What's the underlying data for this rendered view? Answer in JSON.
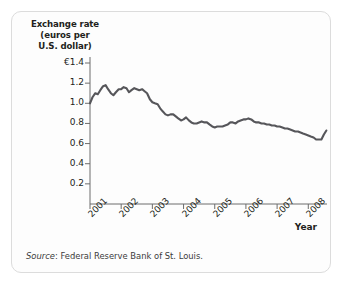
{
  "figure": {
    "y_axis_title_lines": [
      "Exchange rate",
      "(euros per",
      "U.S. dollar)"
    ],
    "x_axis_title": "Year",
    "source_label": "Source",
    "source_text": ": Federal Reserve Bank of St. Louis.",
    "line_color": "#56565a",
    "axis_color": "#6d6d6d",
    "text_color": "#231f20"
  },
  "chart_data": {
    "type": "line",
    "title": "",
    "xlabel": "Year",
    "ylabel": "Exchange rate (euros per U.S. dollar)",
    "ylim": [
      0,
      1.4
    ],
    "xlim": [
      2001,
      2008.6
    ],
    "grid": false,
    "legend": "none",
    "ytick_labels": [
      "€1.4",
      "1.2",
      "1.0",
      "0.8",
      "0.6",
      "0.4",
      "0.2"
    ],
    "ytick_values": [
      1.4,
      1.2,
      1.0,
      0.8,
      0.6,
      0.4,
      0.2
    ],
    "xtick_labels": [
      "2001",
      "2002",
      "2003",
      "2004",
      "2005",
      "2006",
      "2007",
      "2008"
    ],
    "xtick_values": [
      2001,
      2002,
      2003,
      2004,
      2005,
      2006,
      2007,
      2008
    ],
    "series": [
      {
        "name": "Euros per U.S. dollar",
        "x": [
          2001.0,
          2001.08,
          2001.17,
          2001.25,
          2001.33,
          2001.42,
          2001.5,
          2001.58,
          2001.67,
          2001.75,
          2001.83,
          2001.92,
          2002.0,
          2002.08,
          2002.17,
          2002.25,
          2002.33,
          2002.42,
          2002.5,
          2002.58,
          2002.67,
          2002.75,
          2002.83,
          2002.92,
          2003.0,
          2003.08,
          2003.17,
          2003.25,
          2003.33,
          2003.42,
          2003.5,
          2003.58,
          2003.67,
          2003.75,
          2003.83,
          2003.92,
          2004.0,
          2004.08,
          2004.17,
          2004.25,
          2004.33,
          2004.42,
          2004.5,
          2004.58,
          2004.67,
          2004.75,
          2004.83,
          2004.92,
          2005.0,
          2005.08,
          2005.17,
          2005.25,
          2005.33,
          2005.42,
          2005.5,
          2005.58,
          2005.67,
          2005.75,
          2005.83,
          2005.92,
          2006.0,
          2006.08,
          2006.17,
          2006.25,
          2006.33,
          2006.42,
          2006.5,
          2006.58,
          2006.67,
          2006.75,
          2006.83,
          2006.92,
          2007.0,
          2007.08,
          2007.17,
          2007.25,
          2007.33,
          2007.42,
          2007.5,
          2007.58,
          2007.67,
          2007.75,
          2007.83,
          2007.92,
          2008.0,
          2008.08,
          2008.17,
          2008.25,
          2008.33,
          2008.42,
          2008.5,
          2008.58
        ],
        "values": [
          1.0,
          1.06,
          1.1,
          1.09,
          1.13,
          1.17,
          1.18,
          1.14,
          1.1,
          1.08,
          1.11,
          1.14,
          1.14,
          1.16,
          1.15,
          1.11,
          1.13,
          1.15,
          1.14,
          1.13,
          1.14,
          1.12,
          1.1,
          1.04,
          1.01,
          1.0,
          0.99,
          0.95,
          0.92,
          0.89,
          0.88,
          0.89,
          0.89,
          0.87,
          0.85,
          0.83,
          0.84,
          0.86,
          0.83,
          0.81,
          0.8,
          0.8,
          0.81,
          0.82,
          0.81,
          0.81,
          0.79,
          0.77,
          0.76,
          0.77,
          0.77,
          0.77,
          0.78,
          0.79,
          0.81,
          0.81,
          0.8,
          0.82,
          0.83,
          0.84,
          0.84,
          0.85,
          0.84,
          0.82,
          0.81,
          0.81,
          0.8,
          0.8,
          0.79,
          0.79,
          0.78,
          0.78,
          0.77,
          0.77,
          0.76,
          0.75,
          0.75,
          0.74,
          0.73,
          0.72,
          0.72,
          0.71,
          0.7,
          0.69,
          0.68,
          0.67,
          0.66,
          0.64,
          0.64,
          0.64,
          0.69,
          0.73
        ]
      }
    ]
  }
}
